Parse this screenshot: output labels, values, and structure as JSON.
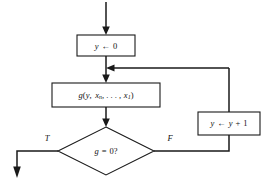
{
  "diagram": {
    "background_color": "#ffffff",
    "line_color": "#1a1a1a",
    "nodes": {
      "init": {
        "shape": "process",
        "var": "y",
        "arrow": "←",
        "value": "0",
        "full_text": "y ← 0"
      },
      "compute": {
        "shape": "process",
        "fn": "g",
        "open_paren": "(",
        "arg1": "y",
        "comma1": ", ",
        "arg2_base": "x",
        "arg2_sub": "n",
        "ellipsis": ", . . . , ",
        "arg3_base": "x",
        "arg3_sub": "1",
        "close_paren": ")",
        "full_text": "g(y, xₙ, . . . , x₁)"
      },
      "decision": {
        "shape": "diamond",
        "expr": "g = 0?",
        "full_text": "g = 0?"
      },
      "increment": {
        "shape": "process",
        "var": "y",
        "arrow": "←",
        "value": "y + 1",
        "full_text": "y ← y + 1"
      }
    },
    "branch_labels": {
      "true": "T",
      "false": "F"
    }
  }
}
